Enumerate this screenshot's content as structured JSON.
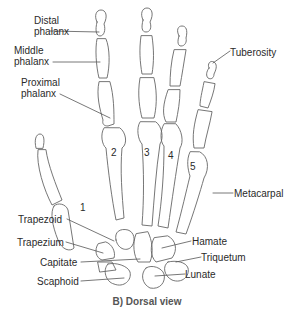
{
  "figure": {
    "caption": "B) Dorsal view",
    "labels": {
      "distal_phalanx": [
        "Distal",
        "phalanx"
      ],
      "middle_phalanx": [
        "Middle",
        "phalanx"
      ],
      "proximal_phalanx": [
        "Proximal",
        "phalanx"
      ],
      "tuberosity": "Tuberosity",
      "metacarpal": "Metacarpal",
      "trapezoid": "Trapezoid",
      "trapezium": "Trapezium",
      "capitate": "Capitate",
      "scaphoid": "Scaphoid",
      "hamate": "Hamate",
      "triquetum": "Triquetum",
      "lunate": "Lunate"
    },
    "metacarpal_numbers": [
      "1",
      "2",
      "3",
      "4",
      "5"
    ],
    "line_color": "#555555"
  }
}
